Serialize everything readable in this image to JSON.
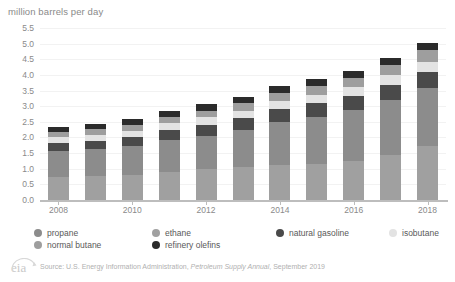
{
  "axis_title": "million barrels per day",
  "source_prefix": "Source: U.S. Energy Information Administration, ",
  "source_italic": "Petroleum Supply Annual",
  "source_suffix": ", September 2019",
  "logo_text": "eia",
  "legend": {
    "items": [
      {
        "label": "propane",
        "color": "#8c8c8c",
        "col": 0,
        "row": 0
      },
      {
        "label": "normal butane",
        "color": "#9e9e9e",
        "col": 0,
        "row": 1
      },
      {
        "label": "ethane",
        "color": "#a0a0a0",
        "col": 1,
        "row": 0
      },
      {
        "label": "refinery olefins",
        "color": "#2b2b2b",
        "col": 1,
        "row": 1
      },
      {
        "label": "natural gasoline",
        "color": "#4a4a4a",
        "col": 2,
        "row": 0
      },
      {
        "label": "isobutane",
        "color": "#e3e3e3",
        "col": 3,
        "row": 0
      }
    ]
  },
  "chart_data": {
    "type": "bar",
    "subtype": "stacked-vertical",
    "title": "",
    "xlabel": "",
    "ylabel": "million barrels per day",
    "ylim": [
      0,
      5.5
    ],
    "ytick_step": 0.5,
    "yticks": [
      "0.0",
      "0.5",
      "1.0",
      "1.5",
      "2.0",
      "2.5",
      "3.0",
      "3.5",
      "4.0",
      "4.5",
      "5.0",
      "5.5"
    ],
    "grid": true,
    "legend_position": "bottom",
    "categories": [
      "2008",
      "2009",
      "2010",
      "2011",
      "2012",
      "2013",
      "2014",
      "2015",
      "2016",
      "2017",
      "2018"
    ],
    "xtick_labels_shown": [
      "2008",
      "2010",
      "2012",
      "2014",
      "2016",
      "2018"
    ],
    "stack_order_bottom_to_top": [
      "ethane",
      "propane",
      "natural gasoline",
      "isobutane",
      "normal butane",
      "refinery olefins"
    ],
    "series": [
      {
        "name": "ethane",
        "color": "#a0a0a0",
        "values": [
          0.72,
          0.76,
          0.81,
          0.9,
          0.98,
          1.05,
          1.11,
          1.15,
          1.25,
          1.45,
          1.72
        ]
      },
      {
        "name": "propane",
        "color": "#8c8c8c",
        "values": [
          0.85,
          0.88,
          0.92,
          1.02,
          1.08,
          1.18,
          1.38,
          1.51,
          1.62,
          1.76,
          1.85
        ]
      },
      {
        "name": "natural gasoline",
        "color": "#4a4a4a",
        "values": [
          0.25,
          0.26,
          0.29,
          0.33,
          0.35,
          0.38,
          0.42,
          0.44,
          0.45,
          0.48,
          0.52
        ]
      },
      {
        "name": "isobutane",
        "color": "#e3e3e3",
        "values": [
          0.18,
          0.19,
          0.2,
          0.22,
          0.23,
          0.24,
          0.26,
          0.27,
          0.28,
          0.3,
          0.32
        ]
      },
      {
        "name": "normal butane",
        "color": "#9e9e9e",
        "values": [
          0.16,
          0.17,
          0.18,
          0.2,
          0.22,
          0.24,
          0.26,
          0.28,
          0.3,
          0.33,
          0.38
        ]
      },
      {
        "name": "refinery olefins",
        "color": "#2b2b2b",
        "values": [
          0.17,
          0.17,
          0.18,
          0.19,
          0.2,
          0.21,
          0.22,
          0.22,
          0.22,
          0.23,
          0.24
        ]
      }
    ],
    "totals": [
      2.33,
      2.43,
      2.58,
      2.86,
      3.06,
      3.3,
      3.65,
      3.87,
      4.12,
      4.55,
      5.03
    ]
  }
}
